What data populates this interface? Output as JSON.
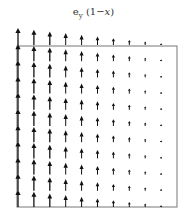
{
  "figure": {
    "title_main": "e",
    "title_sub": "y",
    "title_rest": "(1−",
    "title_var": "x",
    "title_close": ")"
  },
  "chart_data": {
    "type": "vector_field",
    "field": {
      "u": "0",
      "v": "1 - x"
    },
    "x_range": [
      0,
      1
    ],
    "y_range": [
      0,
      1
    ],
    "columns": 10,
    "rows": 11,
    "arrow_direction": "up",
    "magnitude_by_column": [
      1.0,
      0.9,
      0.8,
      0.7,
      0.6,
      0.5,
      0.4,
      0.3,
      0.2,
      0.1
    ],
    "frame": {
      "left": 17,
      "right": 177,
      "top": 46,
      "bottom": 207
    },
    "colors": {
      "arrow": "#111111",
      "frame": "#666666",
      "background": "#ffffff"
    }
  }
}
